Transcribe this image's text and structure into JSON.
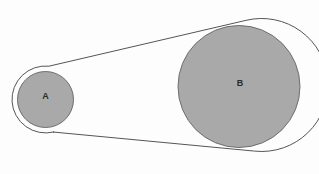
{
  "diagram": {
    "background_color": "#fdfdfd",
    "pulley_fill_color": "#a9a9a9",
    "pulley_stroke_color": "#6e6e6e",
    "belt_stroke_color": "#555555",
    "label_color": "#2b2b2b",
    "pulleys": [
      {
        "label": "A",
        "role": "small-pulley",
        "center_x": 45.5,
        "center_y": 99.5,
        "radius": 28,
        "label_x": 45.5,
        "label_y": 95.5
      },
      {
        "label": "B",
        "role": "large-pulley",
        "center_x": 239,
        "center_y": 86.5,
        "radius": 61,
        "label_x": 240,
        "label_y": 83
      }
    ],
    "belt": {
      "name": "drive-belt",
      "offset": 5.5,
      "stroke_width": 1
    }
  },
  "chart_data": {
    "type": "diagram",
    "elements": [
      {
        "name": "A",
        "shape": "circle",
        "cx": 45.5,
        "cy": 99.5,
        "r": 28,
        "fill": "#a9a9a9"
      },
      {
        "name": "B",
        "shape": "circle",
        "cx": 239,
        "cy": 86.5,
        "r": 61,
        "fill": "#a9a9a9"
      },
      {
        "name": "belt",
        "shape": "open-belt-tangent-loop",
        "wraps": [
          "A",
          "B"
        ],
        "offset": 5.5
      }
    ],
    "annotations": [
      "A",
      "B"
    ],
    "xlabel": "",
    "ylabel": ""
  }
}
